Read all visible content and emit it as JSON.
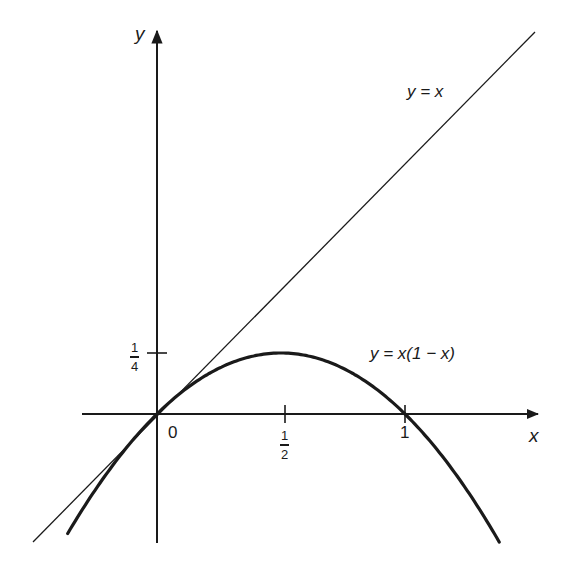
{
  "diagram": {
    "type": "function-plot",
    "axes": {
      "x_label": "x",
      "y_label": "y",
      "origin_label": "0"
    },
    "ticks": {
      "x": [
        {
          "value": 0.5,
          "numerator": "1",
          "denominator": "2"
        },
        {
          "value": 1,
          "label": "1"
        }
      ],
      "y": [
        {
          "value": 0.25,
          "numerator": "1",
          "denominator": "4"
        }
      ]
    },
    "curves": [
      {
        "name": "identity-line",
        "equation": "y = x",
        "label": "y = x",
        "stroke_width": 1.3
      },
      {
        "name": "parabola",
        "equation": "y = x(1 - x)",
        "label": "y = x(1 − x)",
        "stroke_width": 3.2
      }
    ],
    "colors": {
      "ink": "#1a1a1a",
      "background": "#ffffff"
    }
  },
  "chart_data": {
    "type": "line",
    "title": "",
    "xlabel": "x",
    "ylabel": "y",
    "xlim": [
      -0.3,
      1.55
    ],
    "ylim": [
      -0.52,
      1.57
    ],
    "grid": false,
    "x_ticks": [
      "0",
      "1/2",
      "1"
    ],
    "y_ticks": [
      "1/4"
    ],
    "series": [
      {
        "name": "y = x",
        "x": [
          -0.5,
          1.52
        ],
        "y": [
          -0.52,
          1.57
        ]
      },
      {
        "name": "y = x(1 - x)",
        "x": [
          -0.36,
          0,
          0.25,
          0.5,
          0.75,
          1,
          1.38
        ],
        "y": [
          -0.49,
          0,
          0.1875,
          0.25,
          0.1875,
          0,
          -0.52
        ]
      }
    ],
    "annotations": [
      "y = x",
      "y = x(1 − x)",
      "0"
    ]
  }
}
